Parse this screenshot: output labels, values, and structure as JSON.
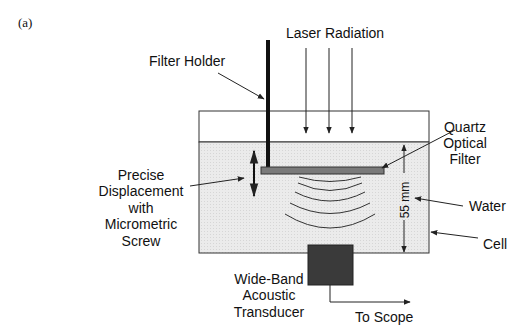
{
  "figure": {
    "panel_label": "(a)",
    "colors": {
      "line": "#222222",
      "water_fill": "#e8e8e8",
      "filter_fill": "#7a7a7a",
      "transducer_fill": "#3a3a3a",
      "background": "#ffffff"
    }
  },
  "labels": {
    "laser_radiation": "Laser Radiation",
    "filter_holder": "Filter Holder",
    "quartz_filter": [
      "Quartz",
      "Optical",
      "Filter"
    ],
    "displacement": [
      "Precise",
      "Displacement",
      "with",
      "Micrometric",
      "Screw"
    ],
    "water": "Water",
    "cell": "Cell",
    "distance": "55 mm",
    "transducer": [
      "Wide-Band",
      "Acoustic",
      "Transducer"
    ],
    "to_scope": "To Scope"
  }
}
